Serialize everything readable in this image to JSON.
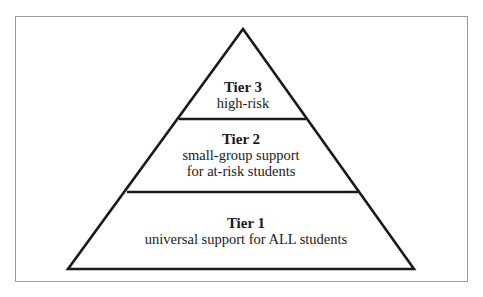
{
  "diagram": {
    "type": "pyramid",
    "colors": {
      "stroke": "#1a1a1a",
      "frame": "#9a9a9a",
      "fill": "#ffffff"
    },
    "tiers": [
      {
        "title": "Tier 3",
        "lines": [
          "high-risk"
        ]
      },
      {
        "title": "Tier 2",
        "lines": [
          "small-group support",
          "for at-risk students"
        ]
      },
      {
        "title": "Tier 1",
        "lines": [
          "universal support for ALL students"
        ]
      }
    ]
  }
}
